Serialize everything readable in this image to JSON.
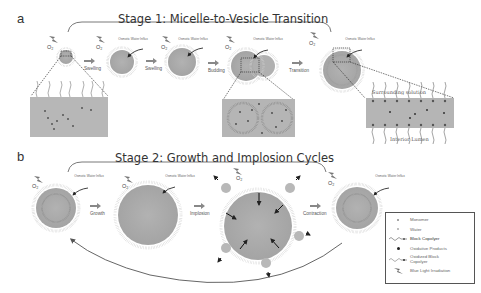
{
  "figure": {
    "panel_a": {
      "letter": "a",
      "title": "Stage 1: Micelle-to-Vesicle Transition",
      "steps": [
        "Swelling",
        "Swelling",
        "Budding",
        "Transition"
      ],
      "annotation": "Osmotic Water Influx",
      "oxygen_label": "O₂",
      "inset_labels": {
        "surrounding": "Surrounding solution",
        "interior": "Interior Lumen"
      }
    },
    "panel_b": {
      "letter": "b",
      "title": "Stage 2: Growth and Implosion Cycles",
      "steps": [
        "Growth",
        "Implosion",
        "Contraction"
      ],
      "annotation": "Osmotic Water Influx",
      "oxygen_label": "O₂"
    },
    "legend": {
      "items": [
        {
          "symbol": "monomer-dot",
          "label": "Monomer"
        },
        {
          "symbol": "water-dot",
          "label": "Water"
        },
        {
          "symbol": "block-copolymer",
          "label": "Block Copolyer"
        },
        {
          "symbol": "oxidative-dot",
          "label": "Oxidative Products"
        },
        {
          "symbol": "oxidized-copolymer",
          "label": "Oxidized Block Copolyer"
        },
        {
          "symbol": "lightning-icon",
          "label": "Blue Light Irradiation"
        }
      ]
    },
    "colors": {
      "vesicle_fill": "#a9a9a9",
      "inset_fill": "#b4b4b4",
      "text": "#333333",
      "arrow": "#888888"
    }
  }
}
